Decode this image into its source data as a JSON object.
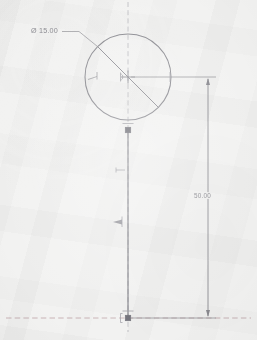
{
  "document": {
    "type": "cad-sketch",
    "title": "CAD sketch - circle with vertical line",
    "background_color": "#f2f2f1",
    "line_color": "#8b8b91",
    "construction_color": "#a8a8ae",
    "text_color": "#8c8c92"
  },
  "annotations": {
    "diameter": {
      "label": "Ø 15.00",
      "value": 15.0,
      "symbol": "diameter-symbol"
    },
    "length": {
      "label": "50.00",
      "value": 50.0
    }
  },
  "geometry": {
    "circle": {
      "name": "circle",
      "center_x": 128,
      "center_y": 77,
      "radius": 43,
      "diameter_label": "Ø 15.00"
    },
    "vertical_line": {
      "name": "vertical-line",
      "x": 128,
      "y_start": 130,
      "y_end": 318,
      "length_label": "50.00"
    },
    "points": [
      {
        "name": "circle-center-point",
        "x": 128,
        "y": 77,
        "style": "cross"
      },
      {
        "name": "circle-bottom-point",
        "x": 128,
        "y": 130,
        "style": "square"
      },
      {
        "name": "line-bottom-point",
        "x": 128,
        "y": 318,
        "style": "square"
      }
    ],
    "centerlines": [
      {
        "name": "vertical-centerline",
        "orientation": "vertical",
        "position": 128
      },
      {
        "name": "horizontal-centerline",
        "orientation": "horizontal",
        "position": 318
      }
    ],
    "constraints": [
      {
        "name": "constraint-marker-coincident-upper",
        "x": 121,
        "y": 170
      },
      {
        "name": "constraint-marker-coincident-lower",
        "x": 120,
        "y": 222
      },
      {
        "name": "constraint-marker-circle-left",
        "x": 93,
        "y": 78
      },
      {
        "name": "constraint-marker-circle-center",
        "x": 123,
        "y": 77
      }
    ],
    "dimension_lines": [
      {
        "name": "vertical-dimension-line",
        "x": 208,
        "y_start": 77,
        "y_end": 318,
        "label": "50.00",
        "arrows": "both-ends"
      }
    ]
  }
}
